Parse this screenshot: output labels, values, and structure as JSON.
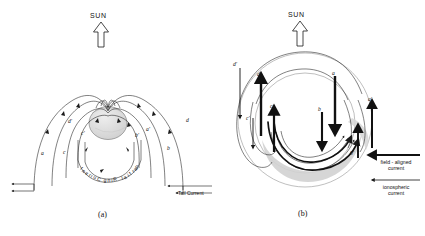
{
  "figure": {
    "background_color": "#ffffff",
    "line_color": "#1a1a1a",
    "earth_fill": "#d9d9d9",
    "shade_fill": "#cfcfcf"
  },
  "panel_a": {
    "caption": "(a)",
    "sun_label": "SUN",
    "sun_arrow_direction": "up",
    "ring_current_label": "Partial Ring Current",
    "tail_current_label": "Tail Current",
    "field_line_labels": [
      "a",
      "b",
      "c",
      "d",
      "a'",
      "b'",
      "c'",
      "d'"
    ]
  },
  "panel_b": {
    "caption": "(b)",
    "sun_label": "SUN",
    "sun_arrow_direction": "up",
    "field_line_labels": [
      "a",
      "b",
      "c",
      "d",
      "a'",
      "b'",
      "c'",
      "d'"
    ],
    "legend": [
      {
        "name": "field-aligned-current",
        "line1": "field - aligned",
        "line2": "current",
        "style": "thick"
      },
      {
        "name": "ionospheric-current",
        "line1": "ionospheric",
        "line2": "current",
        "style": "thin"
      }
    ]
  },
  "chart_data": {
    "type": "diagram",
    "panels": [
      {
        "id": "a",
        "caption": "(a)",
        "description": "Meridional / three-dimensional view of magnetic field lines draping over the Earth with partial ring current and tail current",
        "annotations": [
          "SUN",
          "Partial Ring Current",
          "Tail Current"
        ],
        "field_line_labels": [
          "a",
          "b",
          "c",
          "d",
          "a'",
          "b'",
          "c'",
          "d'"
        ]
      },
      {
        "id": "b",
        "caption": "(b)",
        "description": "Polar view of field-aligned currents connecting to the ionospheric current in the auroral oval",
        "annotations": [
          "SUN",
          "field - aligned current",
          "ionospheric current"
        ],
        "field_line_labels": [
          "a",
          "b",
          "c",
          "d",
          "a'",
          "b'",
          "c'",
          "d'"
        ]
      }
    ]
  }
}
